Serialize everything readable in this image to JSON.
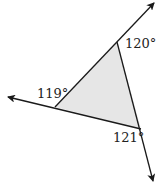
{
  "diagram": {
    "colors": {
      "line": "#1a1a1a",
      "fill": "#e6e6e6",
      "text": "#222222",
      "background": "#ffffff"
    },
    "vertices": {
      "top": {
        "x": 117,
        "y": 42
      },
      "left": {
        "x": 55,
        "y": 107
      },
      "bottom_right": {
        "x": 141,
        "y": 129
      }
    },
    "rays": [
      {
        "name": "ray-top-right",
        "from": {
          "x": 55,
          "y": 107
        },
        "to": {
          "x": 154,
          "y": 3
        }
      },
      {
        "name": "ray-left",
        "from": {
          "x": 141,
          "y": 129
        },
        "to": {
          "x": 8,
          "y": 97
        }
      },
      {
        "name": "ray-bottom",
        "from": {
          "x": 117,
          "y": 42
        },
        "to": {
          "x": 153,
          "y": 181
        }
      }
    ],
    "angles": [
      {
        "label": "120°",
        "value": 120,
        "vertex": "top",
        "x": 125,
        "y": 48
      },
      {
        "label": "119°",
        "value": 119,
        "vertex": "left",
        "x": 37,
        "y": 98
      },
      {
        "label": "121°",
        "value": 121,
        "vertex": "bottom_right",
        "x": 113,
        "y": 142
      }
    ]
  }
}
